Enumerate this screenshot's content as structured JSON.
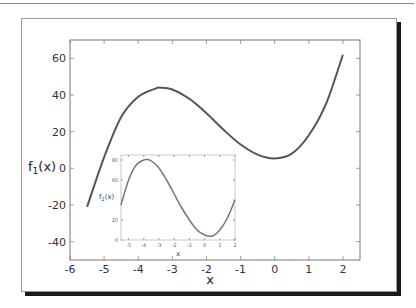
{
  "chart_data": [
    {
      "type": "line",
      "title": "",
      "xlabel": "x",
      "ylabel": "f1(x)",
      "xlim": [
        -6,
        2.5
      ],
      "ylim": [
        -50,
        70
      ],
      "xticks": [
        -6,
        -5,
        -4,
        -3,
        -2,
        -1,
        0,
        1,
        2
      ],
      "yticks": [
        -40,
        -20,
        0,
        20,
        40,
        60
      ],
      "grid": false,
      "series": [
        {
          "name": "f1(x)",
          "color": "#555555",
          "x": [
            -5.5,
            -5.0,
            -4.5,
            -4.0,
            -3.5,
            -3.33,
            -3.0,
            -2.5,
            -2.0,
            -1.5,
            -1.0,
            -0.5,
            0.0,
            0.5,
            1.0,
            1.5,
            2.0
          ],
          "y": [
            -21,
            6,
            28,
            39,
            43.5,
            44,
            43,
            38,
            30,
            21,
            13,
            7.5,
            5.4,
            8,
            18,
            35,
            62
          ]
        }
      ]
    },
    {
      "type": "line",
      "title": "",
      "xlabel": "x",
      "ylabel": "f2(x)",
      "xlim": [
        -5.5,
        2
      ],
      "ylim": [
        0,
        85
      ],
      "xticks": [
        -5,
        -4,
        -3,
        -2,
        -1,
        0,
        1,
        2
      ],
      "yticks": [
        0,
        20,
        40,
        60,
        80
      ],
      "grid": false,
      "inset": true,
      "series": [
        {
          "name": "f2(x)",
          "color": "#777777",
          "x": [
            -5.5,
            -5.0,
            -4.5,
            -4.0,
            -3.8,
            -3.5,
            -3.0,
            -2.5,
            -2.0,
            -1.5,
            -1.0,
            -0.5,
            0.0,
            0.5,
            1.0,
            1.5,
            2.0
          ],
          "y": [
            35,
            60,
            75,
            80,
            80.5,
            79,
            72,
            60,
            46,
            32,
            20,
            10,
            5,
            4,
            10,
            22,
            40
          ]
        }
      ]
    }
  ],
  "main": {
    "xlabel": "x",
    "ylabel_base": "f",
    "ylabel_sub": "1",
    "ylabel_tail": "(x)",
    "xticks": [
      "-6",
      "-5",
      "-4",
      "-3",
      "-2",
      "-1",
      "0",
      "1",
      "2"
    ],
    "yticks": [
      "60",
      "40",
      "20",
      "0",
      "-20",
      "-40"
    ]
  },
  "inset": {
    "xlabel": "x",
    "ylabel_base": "f",
    "ylabel_sub": "2",
    "ylabel_tail": "(x)",
    "xticks": [
      "-5",
      "-4",
      "-3",
      "-2",
      "-1",
      "0",
      "1",
      "2"
    ],
    "yticks": [
      "80",
      "60",
      "20",
      "0"
    ]
  }
}
